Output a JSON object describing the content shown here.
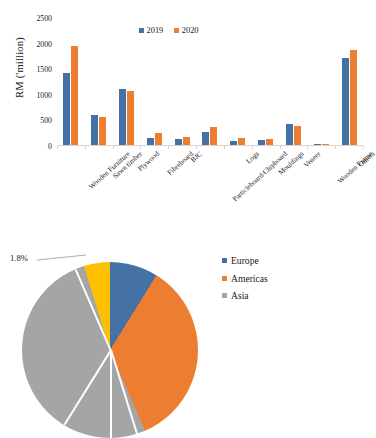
{
  "colors": {
    "series_2019": "#4472A4",
    "series_2020": "#ED7D31",
    "europe": "#4472A4",
    "americas": "#ED7D31",
    "asia": "#A5A5A5",
    "other_region": "#FFC000",
    "axis": "#D4D4D4",
    "text": "#1A1A1A"
  },
  "bar_chart": {
    "y_axis_title": "RM ('million)",
    "legend": [
      {
        "label": "2019",
        "color": "#4472A4"
      },
      {
        "label": "2020",
        "color": "#ED7D31"
      }
    ]
  },
  "pie_chart": {
    "legend": [
      {
        "label": "Europe",
        "color": "#4472A4"
      },
      {
        "label": "Americas",
        "color": "#ED7D31"
      },
      {
        "label": "Asia",
        "color": "#A5A5A5"
      }
    ],
    "labels": [
      {
        "text": "8.7%",
        "style": "light"
      },
      {
        "text": "4.7%",
        "style": "light"
      },
      {
        "text": "1.8%",
        "style": "dark"
      }
    ]
  },
  "chart_data": [
    {
      "type": "bar",
      "title": "",
      "xlabel": "",
      "ylabel": "RM ('million)",
      "ylim": [
        0,
        2500
      ],
      "yticks": [
        0,
        500,
        1000,
        1500,
        2000,
        2500
      ],
      "grid": false,
      "legend_position": "top-center",
      "categories": [
        "Wooden Furniture",
        "Sawn timber",
        "Plywood",
        "Fibreboard",
        "BJC",
        "Particleboard/Chipboard",
        "Logs",
        "Mouldings",
        "Veneer",
        "Wooden Frame",
        "Others"
      ],
      "series": [
        {
          "name": "2019",
          "color": "#4472A4",
          "values": [
            1400,
            580,
            1100,
            140,
            120,
            245,
            80,
            100,
            420,
            8,
            1700
          ]
        },
        {
          "name": "2020",
          "color": "#ED7D31",
          "values": [
            1930,
            550,
            1050,
            230,
            150,
            350,
            140,
            115,
            380,
            6,
            1850
          ]
        }
      ]
    },
    {
      "type": "pie",
      "title": "",
      "legend_position": "right",
      "labels": [
        "Europe",
        "Americas",
        "Asia",
        "Other"
      ],
      "values": [
        8.7,
        34.0,
        50.8,
        4.7
      ],
      "annotated_percentages": [
        "8.7%",
        "4.7%",
        "1.8%"
      ],
      "colors": [
        "#4472A4",
        "#ED7D31",
        "#A5A5A5",
        "#FFC000"
      ]
    }
  ]
}
